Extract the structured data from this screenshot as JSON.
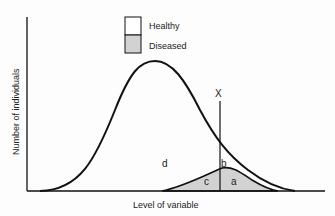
{
  "legend": {
    "items": [
      {
        "label": "Healthy",
        "fill": "#ffffff"
      },
      {
        "label": "Diseased",
        "fill": "#d2d2d2"
      }
    ]
  },
  "axes": {
    "ylabel": "Number of individuals",
    "xlabel": "Level of variable"
  },
  "threshold": {
    "label": "X"
  },
  "regions": {
    "a": "a",
    "b": "b",
    "c": "c",
    "d": "d"
  },
  "colors": {
    "line": "#111111",
    "diseased_fill": "#d2d2d2",
    "background": "#fdfdfd"
  }
}
